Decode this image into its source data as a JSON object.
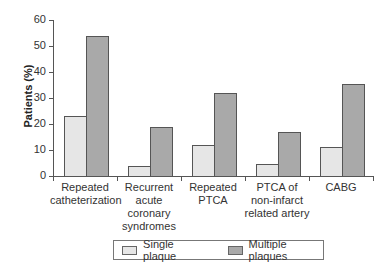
{
  "chart_data": {
    "type": "bar",
    "title": "",
    "xlabel": "",
    "ylabel": "Patients (%)",
    "ylim": [
      0,
      60
    ],
    "yticks": [
      0,
      10,
      20,
      30,
      40,
      50,
      60
    ],
    "grid": false,
    "legend_position": "bottom",
    "categories": [
      "Repeated catheterization",
      "Recurrent acute coronary syndromes",
      "Repeated PTCA",
      "PTCA of non-infarct related artery",
      "CABG"
    ],
    "category_lines": [
      [
        "Repeated",
        "catheterization"
      ],
      [
        "Recurrent",
        "acute",
        "coronary",
        "syndromes"
      ],
      [
        "Repeated",
        "PTCA"
      ],
      [
        "PTCA of",
        "non-infarct",
        "related artery"
      ],
      [
        "CABG"
      ]
    ],
    "series": [
      {
        "name": "Single plaque",
        "color": "#e6e6e6",
        "values": [
          23,
          4,
          12,
          4.5,
          11
        ]
      },
      {
        "name": "Multiple plaques",
        "color": "#a9a9a9",
        "values": [
          54,
          19,
          32,
          17,
          35.5
        ]
      }
    ]
  },
  "legend": {
    "items": [
      {
        "label": "Single plaque",
        "color": "#e6e6e6"
      },
      {
        "label": "Multiple plaques",
        "color": "#a9a9a9"
      }
    ]
  }
}
